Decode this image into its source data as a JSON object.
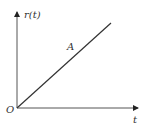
{
  "diagram": {
    "y_axis_label": "r(t)",
    "x_axis_label": "t",
    "origin_label": "O",
    "line_label": "A",
    "line_color": "#333333",
    "axis_color": "#555555"
  }
}
